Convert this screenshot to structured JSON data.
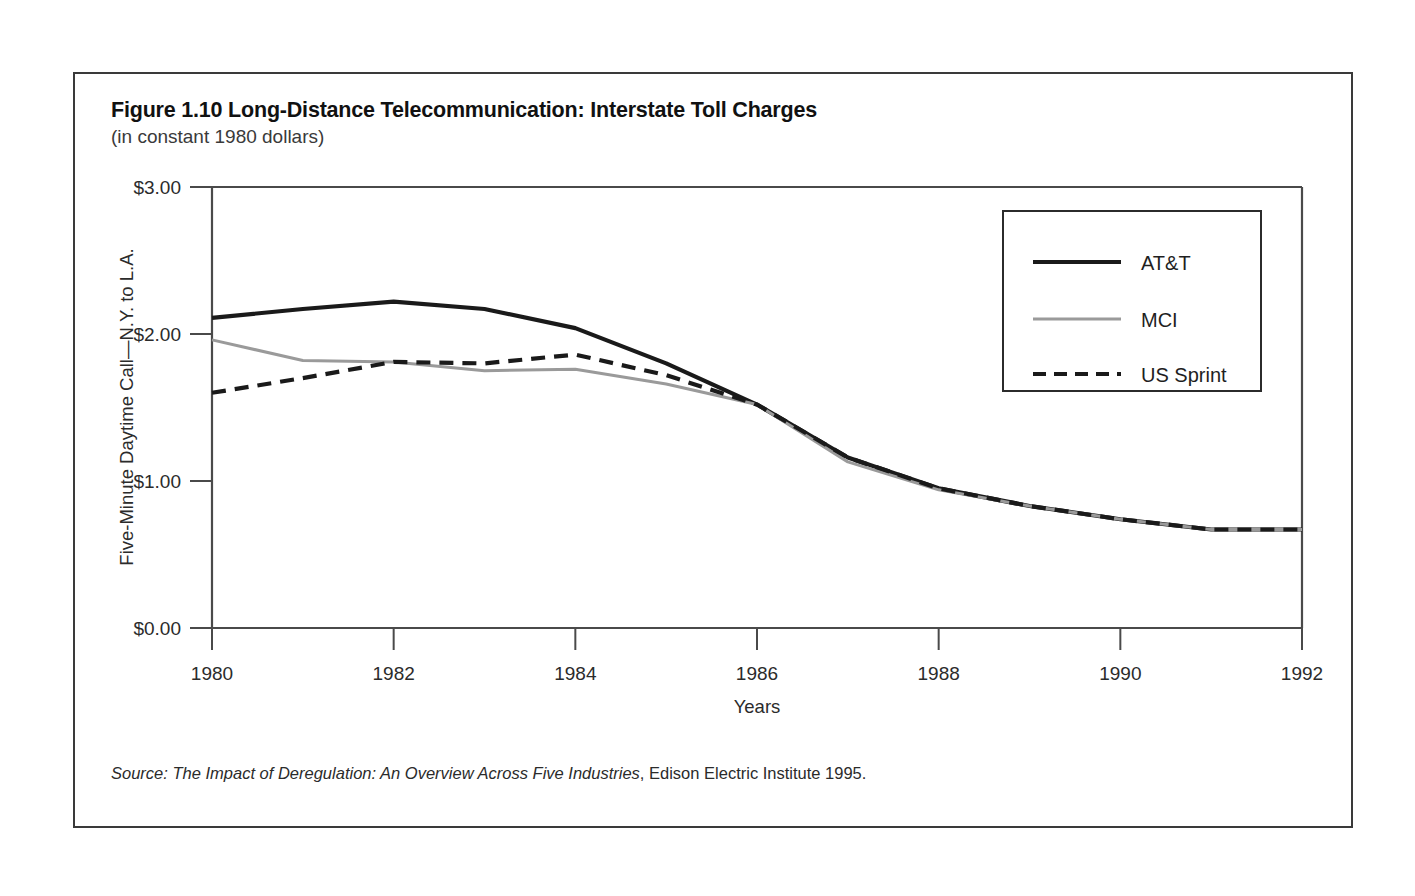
{
  "figure": {
    "title": "Figure 1.10 Long-Distance Telecommunication: Interstate Toll Charges",
    "subtitle": "(in constant 1980 dollars)",
    "source_label": "Source:",
    "source_work": " The Impact of Deregulation: An Overview Across Five Industries",
    "source_publisher": ", Edison Electric Institute 1995."
  },
  "axes": {
    "ylabel": "Five-Minute Daytime Call—N.Y. to L.A.",
    "xlabel": "Years",
    "ytick_labels": [
      "$3.00",
      "$2.00",
      "$1.00",
      "$0.00"
    ],
    "xtick_labels": [
      "1980",
      "1982",
      "1984",
      "1986",
      "1988",
      "1990",
      "1992"
    ]
  },
  "legend": {
    "items": [
      {
        "label": "AT&T",
        "style": "solid-thick",
        "color": "#1a1a1a"
      },
      {
        "label": "MCI",
        "style": "solid-thin",
        "color": "#9a9a9a"
      },
      {
        "label": "US Sprint",
        "style": "dashed",
        "color": "#1a1a1a"
      }
    ]
  },
  "chart_data": {
    "type": "line",
    "title": "Figure 1.10 Long-Distance Telecommunication: Interstate Toll Charges",
    "subtitle": "(in constant 1980 dollars)",
    "xlabel": "Years",
    "ylabel": "Five-Minute Daytime Call—N.Y. to L.A.",
    "xlim": [
      1980,
      1992
    ],
    "ylim": [
      0.0,
      3.0
    ],
    "ytick_values": [
      0.0,
      1.0,
      2.0,
      3.0
    ],
    "ytick_labels": [
      "$0.00",
      "$1.00",
      "$2.00",
      "$3.00"
    ],
    "xtick_values": [
      1980,
      1982,
      1984,
      1986,
      1988,
      1990,
      1992
    ],
    "xtick_labels": [
      "1980",
      "1982",
      "1984",
      "1986",
      "1988",
      "1990",
      "1992"
    ],
    "grid": false,
    "legend_position": "upper right",
    "units": "constant 1980 US dollars",
    "x": [
      1980,
      1981,
      1982,
      1983,
      1984,
      1985,
      1986,
      1987,
      1988,
      1989,
      1990,
      1991,
      1992
    ],
    "series": [
      {
        "name": "AT&T",
        "color": "#1a1a1a",
        "style": "solid-thick",
        "values": [
          2.11,
          2.17,
          2.22,
          2.17,
          2.04,
          1.8,
          1.52,
          1.16,
          0.95,
          0.83,
          0.74,
          0.67,
          0.67
        ]
      },
      {
        "name": "MCI",
        "color": "#9a9a9a",
        "style": "solid-thin",
        "values": [
          1.96,
          1.82,
          1.81,
          1.75,
          1.76,
          1.66,
          1.52,
          1.13,
          0.94,
          0.83,
          0.74,
          0.67,
          0.67
        ]
      },
      {
        "name": "US Sprint",
        "color": "#1a1a1a",
        "style": "dashed",
        "values": [
          1.6,
          1.7,
          1.81,
          1.8,
          1.86,
          1.72,
          1.52,
          1.16,
          0.95,
          0.83,
          0.74,
          0.67,
          0.67
        ]
      }
    ]
  }
}
